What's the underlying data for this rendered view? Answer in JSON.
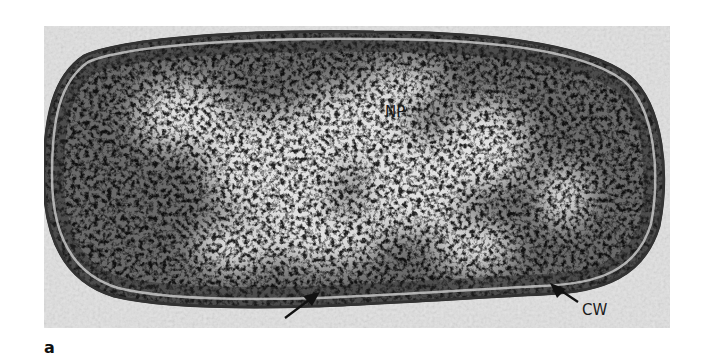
{
  "figure": {
    "panel_label": "a",
    "labels": {
      "nucleoid": "NP",
      "cell_wall": "CW"
    },
    "annotations": [
      {
        "type": "arrow",
        "points_to": "cell wall (lower edge)",
        "label": ""
      },
      {
        "type": "arrow",
        "points_to": "cell wall",
        "label": "CW"
      }
    ],
    "colors": {
      "background": "#e6e6e6",
      "cytoplasm_dark": "#2a2a2a",
      "nucleoid_light": "#d8d8d8",
      "wall": "#3a3a3a"
    }
  }
}
